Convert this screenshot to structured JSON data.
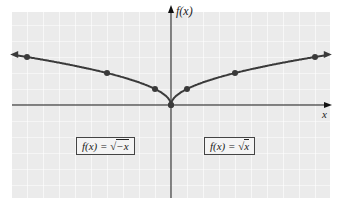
{
  "chart_data": {
    "type": "line",
    "title": "",
    "xlabel": "x",
    "ylabel": "f(x)",
    "grid": true,
    "xlim": [
      -10,
      10
    ],
    "ylim": [
      -6,
      6
    ],
    "series": [
      {
        "name": "f(x) = √(-x)",
        "x": [
          -9,
          -4,
          -1,
          0
        ],
        "y": [
          3,
          2,
          1,
          0
        ]
      },
      {
        "name": "f(x) = √x",
        "x": [
          0,
          1,
          4,
          9
        ],
        "y": [
          0,
          1,
          2,
          3
        ]
      }
    ],
    "annotations": [
      "f(x) = √−x",
      "f(x) = √x"
    ]
  },
  "labels": {
    "y_axis": "f(x)",
    "x_axis": "x",
    "left_box_prefix": "f(x) = ",
    "left_box_radicand": "−x",
    "right_box_prefix": "f(x) = ",
    "right_box_radicand": "x"
  },
  "colors": {
    "curve": "#3a3a3a",
    "grid_bg": "#ebebeb",
    "grid_line": "#ffffff",
    "axis": "#111111"
  }
}
